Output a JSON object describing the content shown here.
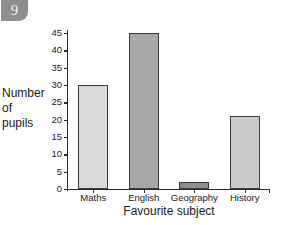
{
  "badge": {
    "number": "9"
  },
  "chart_data": {
    "type": "bar",
    "title": "",
    "categories": [
      "Maths",
      "English",
      "Geography",
      "History"
    ],
    "values": [
      30,
      45,
      2,
      21
    ],
    "bar_colors": [
      "#d9d9d9",
      "#a8a8a8",
      "#8f8f8f",
      "#c9c9c9"
    ],
    "xlabel": "Favourite subject",
    "ylabel": "Number of pupils",
    "ylabel_lines": [
      "Number",
      "of",
      "pupils"
    ],
    "ylim": [
      0,
      45
    ],
    "ytick_step": 5,
    "yticks": [
      0,
      5,
      10,
      15,
      20,
      25,
      30,
      35,
      40,
      45
    ],
    "ytick_labels": [
      "0",
      "5",
      "10",
      "15",
      "20",
      "25",
      "30",
      "35",
      "40",
      "45"
    ],
    "grid": false,
    "legend": null
  }
}
